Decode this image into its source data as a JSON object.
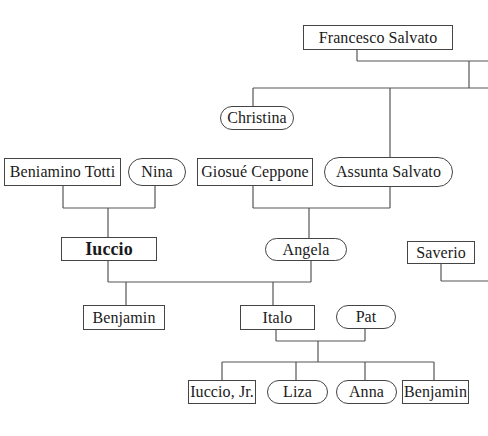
{
  "diagram": {
    "type": "family-tree",
    "legend_convention": {
      "rectangle": "male",
      "rounded": "female"
    },
    "nodes": {
      "francesco_salvato": {
        "label": "Francesco Salvato",
        "shape": "rectangle"
      },
      "christina": {
        "label": "Christina",
        "shape": "rounded"
      },
      "beniamino_totti": {
        "label": "Beniamino Totti",
        "shape": "rectangle"
      },
      "nina": {
        "label": "Nina",
        "shape": "rounded"
      },
      "giosue_ceppone": {
        "label": "Giosué Ceppone",
        "shape": "rectangle"
      },
      "assunta_salvato": {
        "label": "Assunta Salvato",
        "shape": "rounded"
      },
      "iuccio": {
        "label": "Iuccio",
        "shape": "rectangle",
        "emphasis": "bold"
      },
      "angela": {
        "label": "Angela",
        "shape": "rounded"
      },
      "saverio": {
        "label": "Saverio",
        "shape": "rectangle"
      },
      "benjamin_1": {
        "label": "Benjamin",
        "shape": "rectangle"
      },
      "italo": {
        "label": "Italo",
        "shape": "rectangle"
      },
      "pat": {
        "label": "Pat",
        "shape": "rounded"
      },
      "iuccio_jr": {
        "label": "Iuccio, Jr.",
        "shape": "rectangle"
      },
      "liza": {
        "label": "Liza",
        "shape": "rounded"
      },
      "anna": {
        "label": "Anna",
        "shape": "rounded"
      },
      "benjamin_2": {
        "label": "Benjamin",
        "shape": "rectangle"
      }
    },
    "relationships": [
      {
        "parents": [
          "francesco_salvato"
        ],
        "children": [
          "christina",
          "assunta_salvato"
        ]
      },
      {
        "parents": [
          "beniamino_totti",
          "nina"
        ],
        "children": [
          "iuccio"
        ]
      },
      {
        "parents": [
          "giosue_ceppone",
          "assunta_salvato"
        ],
        "children": [
          "angela"
        ]
      },
      {
        "parents": [
          "iuccio",
          "angela"
        ],
        "children": [
          "benjamin_1",
          "italo"
        ]
      },
      {
        "parents": [
          "italo",
          "pat"
        ],
        "children": [
          "iuccio_jr",
          "liza",
          "anna",
          "benjamin_2"
        ]
      }
    ]
  }
}
